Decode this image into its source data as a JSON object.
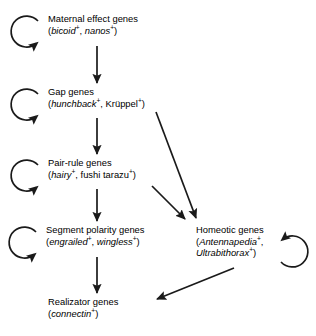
{
  "diagram": {
    "stroke_color": "#1a1a1a",
    "text_color": "#000000",
    "background": "#ffffff",
    "nodes": [
      {
        "id": "maternal",
        "name": "Maternal effect genes",
        "genes_text": "(bicoid+, nanos+)",
        "gene1": "bicoid",
        "gene1_sup": "+",
        "sep": ", ",
        "gene2": "nanos",
        "gene2_sup": "+",
        "open_paren": "(",
        "close_paren": ")",
        "self_loop": "left"
      },
      {
        "id": "gap",
        "name": "Gap genes",
        "genes_text": "(hunchback+, Krüppel+)",
        "gene1": "hunchback",
        "gene1_sup": "+",
        "sep": ", ",
        "gene2": "Krüppel",
        "gene2_sup": "+",
        "open_paren": "(",
        "close_paren": ")",
        "self_loop": "left"
      },
      {
        "id": "pair",
        "name": "Pair-rule genes",
        "genes_text": "(hairy+, fushi tarazu+)",
        "gene1": "hairy",
        "gene1_sup": "+",
        "sep": ", ",
        "gene2": "fushi tarazu",
        "gene2_sup": "+",
        "open_paren": "(",
        "close_paren": ")",
        "self_loop": "left"
      },
      {
        "id": "segment",
        "name": "Segment polarity genes",
        "genes_text": "(engrailed+, wingless+)",
        "gene1": "engrailed",
        "gene1_sup": "+",
        "sep": ", ",
        "gene2": "wingless",
        "gene2_sup": "+",
        "open_paren": "(",
        "close_paren": ")",
        "self_loop": "left"
      },
      {
        "id": "homeotic",
        "name": "Homeotic genes",
        "genes_text": "(Antennapedia+, Ultrabithorax+)",
        "gene1": "Antennapedia",
        "gene1_sup": "+",
        "sep": ",",
        "gene2": "Ultrabithorax",
        "gene2_sup": "+",
        "open_paren": "(",
        "close_paren": ")",
        "self_loop": "right"
      },
      {
        "id": "realizator",
        "name": "Realizator genes",
        "genes_text": "(connectin+)",
        "gene1": "connectin",
        "gene1_sup": "+",
        "open_paren": "(",
        "close_paren": ")",
        "self_loop": "none"
      }
    ],
    "edges": [
      {
        "from": "maternal",
        "to": "gap",
        "kind": "vertical"
      },
      {
        "from": "gap",
        "to": "pair",
        "kind": "vertical"
      },
      {
        "from": "pair",
        "to": "segment",
        "kind": "vertical"
      },
      {
        "from": "segment",
        "to": "realizator",
        "kind": "vertical"
      },
      {
        "from": "gap",
        "to": "homeotic",
        "kind": "diagonal"
      },
      {
        "from": "pair",
        "to": "homeotic",
        "kind": "diagonal"
      },
      {
        "from": "homeotic",
        "to": "realizator",
        "kind": "diagonal"
      }
    ]
  }
}
